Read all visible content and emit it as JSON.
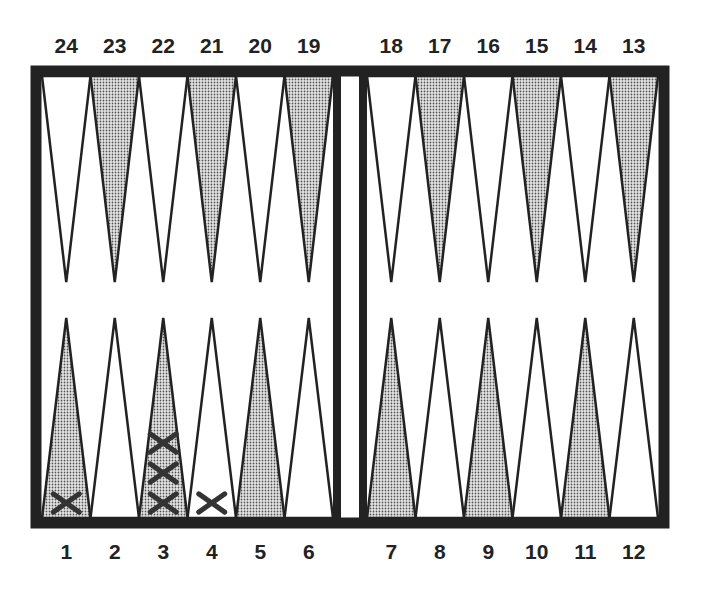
{
  "board": {
    "top_labels": [
      "24",
      "23",
      "22",
      "21",
      "20",
      "19",
      "18",
      "17",
      "16",
      "15",
      "14",
      "13"
    ],
    "bottom_labels": [
      "1",
      "2",
      "3",
      "4",
      "5",
      "6",
      "7",
      "8",
      "9",
      "10",
      "11",
      "12"
    ],
    "colors": {
      "frame": "#222222",
      "shaded": "#b8b8b8",
      "light": "#ffffff",
      "checker": "#333333"
    },
    "shaded_top": [
      "23",
      "21",
      "19",
      "17",
      "15",
      "13"
    ],
    "shaded_bottom": [
      "1",
      "3",
      "5",
      "7",
      "9",
      "11"
    ]
  },
  "checkers": [
    {
      "point": "1",
      "count": 1,
      "symbol": "X"
    },
    {
      "point": "3",
      "count": 3,
      "symbol": "X"
    },
    {
      "point": "4",
      "count": 1,
      "symbol": "X"
    }
  ]
}
